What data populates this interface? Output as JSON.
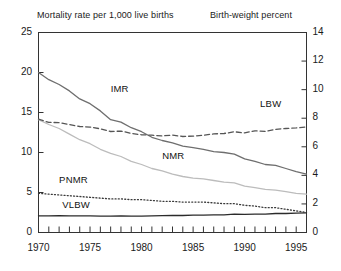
{
  "chart_data": {
    "type": "line",
    "title": "",
    "xlabel": "",
    "ylabel": "Mortality rate per 1,000 live births",
    "y2label": "Birth-weight percent",
    "xlim": [
      1970,
      1996
    ],
    "ylim": [
      0,
      25
    ],
    "y2lim": [
      0,
      14
    ],
    "grid": false,
    "legend": "inline-labels",
    "left_axis_title": "Mortality rate per 1,000 live births",
    "right_axis_title": "Birth-weight percent",
    "left_ticks": [
      "0",
      "5",
      "10",
      "15",
      "20",
      "25"
    ],
    "left_tick_values": [
      0,
      5,
      10,
      15,
      20,
      25
    ],
    "right_ticks": [
      "0",
      "2",
      "4",
      "6",
      "8",
      "10",
      "12",
      "14"
    ],
    "right_tick_values": [
      0,
      2,
      4,
      6,
      8,
      10,
      12,
      14
    ],
    "x_ticks": [
      "1970",
      "1975",
      "1980",
      "1985",
      "1990",
      "1995"
    ],
    "x_tick_values": [
      1970,
      1975,
      1980,
      1985,
      1990,
      1995
    ],
    "x_minor_tick_values": [
      1970,
      1971,
      1972,
      1973,
      1974,
      1975,
      1976,
      1977,
      1978,
      1979,
      1980,
      1981,
      1982,
      1983,
      1984,
      1985,
      1986,
      1987,
      1988,
      1989,
      1990,
      1991,
      1992,
      1993,
      1994,
      1995,
      1996
    ],
    "x": [
      1970,
      1971,
      1972,
      1973,
      1974,
      1975,
      1976,
      1977,
      1978,
      1979,
      1980,
      1981,
      1982,
      1983,
      1984,
      1985,
      1986,
      1987,
      1988,
      1989,
      1990,
      1991,
      1992,
      1993,
      1994,
      1995,
      1996
    ],
    "series": [
      {
        "name": "IMR",
        "label": "IMR",
        "axis": "left",
        "units": "deaths per 1,000 live births",
        "style": "solid",
        "color": "#6e6e6e",
        "values": [
          20.0,
          19.1,
          18.5,
          17.7,
          16.7,
          16.1,
          15.2,
          14.1,
          13.8,
          13.1,
          12.6,
          11.9,
          11.5,
          11.2,
          10.8,
          10.6,
          10.4,
          10.1,
          10.0,
          9.8,
          9.2,
          8.9,
          8.5,
          8.4,
          8.0,
          7.6,
          7.3
        ]
      },
      {
        "name": "NMR",
        "label": "NMR",
        "axis": "left",
        "units": "deaths per 1,000 live births",
        "style": "solid",
        "color": "#bcbcbc",
        "values": [
          14.1,
          13.5,
          13.0,
          12.3,
          11.6,
          11.1,
          10.4,
          9.9,
          9.5,
          8.9,
          8.5,
          8.0,
          7.7,
          7.3,
          7.0,
          6.8,
          6.7,
          6.5,
          6.3,
          6.2,
          5.8,
          5.6,
          5.4,
          5.3,
          5.1,
          4.9,
          4.8
        ]
      },
      {
        "name": "PNMR",
        "label": "PNMR",
        "axis": "left",
        "units": "deaths per 1,000 live births",
        "style": "dotted",
        "color": "#3a3a3a",
        "values": [
          4.9,
          4.8,
          4.7,
          4.6,
          4.5,
          4.4,
          4.3,
          4.2,
          4.2,
          4.1,
          4.1,
          4.0,
          3.9,
          3.9,
          3.8,
          3.8,
          3.8,
          3.7,
          3.6,
          3.6,
          3.4,
          3.3,
          3.1,
          3.1,
          2.9,
          2.7,
          2.5
        ]
      },
      {
        "name": "LBW",
        "label": "LBW",
        "axis": "right",
        "units": "percent of live births",
        "style": "dashed",
        "color": "#555555",
        "values": [
          7.93,
          7.71,
          7.69,
          7.56,
          7.42,
          7.38,
          7.26,
          7.07,
          7.1,
          6.94,
          6.84,
          6.81,
          6.76,
          6.82,
          6.72,
          6.75,
          6.81,
          6.9,
          6.93,
          7.05,
          6.97,
          7.12,
          7.08,
          7.22,
          7.28,
          7.32,
          7.39
        ]
      },
      {
        "name": "VLBW",
        "label": "VLBW",
        "axis": "right",
        "units": "percent of live births",
        "style": "solid",
        "color": "#2b2b2b",
        "values": [
          1.17,
          1.16,
          1.18,
          1.16,
          1.16,
          1.16,
          1.15,
          1.15,
          1.17,
          1.15,
          1.15,
          1.16,
          1.18,
          1.19,
          1.19,
          1.21,
          1.21,
          1.24,
          1.24,
          1.28,
          1.27,
          1.29,
          1.29,
          1.33,
          1.33,
          1.35,
          1.37
        ]
      }
    ],
    "annotations": [
      {
        "text": "IMR",
        "x": 1977.0,
        "y": 18.0,
        "axis": "left"
      },
      {
        "text": "LBW",
        "x": 1991.5,
        "y": 9.0,
        "axis": "right"
      },
      {
        "text": "NMR",
        "x": 1982.0,
        "y": 9.6,
        "axis": "left"
      },
      {
        "text": "PNMR",
        "x": 1972.0,
        "y": 6.6,
        "axis": "left"
      },
      {
        "text": "VLBW",
        "x": 1972.3,
        "y": 3.5,
        "axis": "left"
      }
    ]
  },
  "labels": {
    "imr": "IMR",
    "lbw": "LBW",
    "nmr": "NMR",
    "pnmr": "PNMR",
    "vlbw": "VLBW",
    "title_left": "Mortality rate per 1,000 live births",
    "title_right": "Birth-weight percent",
    "y_left": [
      "25",
      "20",
      "15",
      "10",
      "5",
      "0"
    ],
    "y_right": [
      "14",
      "12",
      "10",
      "8",
      "6",
      "4",
      "2",
      "0"
    ],
    "x": [
      "1970",
      "1975",
      "1980",
      "1985",
      "1990",
      "1995"
    ]
  },
  "colors": {
    "axis": "#333333",
    "imr": "#6e6e6e",
    "nmr": "#bcbcbc",
    "pnmr": "#3a3a3a",
    "lbw": "#555555",
    "vlbw": "#2b2b2b",
    "background": "#ffffff"
  }
}
